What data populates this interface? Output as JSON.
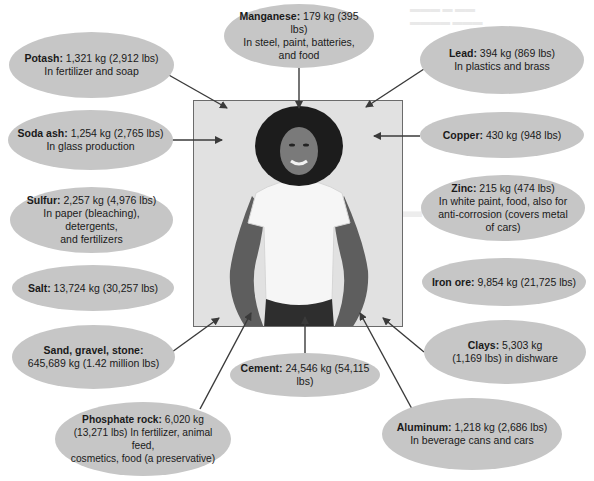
{
  "colors": {
    "bubble_fill": "#c6c6c6",
    "photo_bg": "#e1e1e1",
    "frame_stroke": "#6b6b6b",
    "arrow": "#3a3a3a",
    "text": "#1a1a1a"
  },
  "center": {
    "image_description": "photo of a smiling woman with curly hair in a white t-shirt"
  },
  "minerals": [
    {
      "id": "potash",
      "name": "Potash:",
      "amount": "1,321 kg (2,912 lbs)",
      "lines": [
        "In fertilizer and soap"
      ]
    },
    {
      "id": "manganese",
      "name": "Manganese:",
      "amount": "179 kg (395 lbs)",
      "lines": [
        "In steel, paint, batteries,",
        "and food"
      ]
    },
    {
      "id": "lead",
      "name": "Lead:",
      "amount": "394 kg (869 lbs)",
      "lines": [
        "In plastics and brass"
      ]
    },
    {
      "id": "soda-ash",
      "name": "Soda ash:",
      "amount": "1,254 kg (2,765 lbs)",
      "lines": [
        "In glass production"
      ]
    },
    {
      "id": "copper",
      "name": "Copper:",
      "amount": "430 kg (948 lbs)",
      "lines": []
    },
    {
      "id": "sulfur",
      "name": "Sulfur:",
      "amount": "2,257 kg (4,976 lbs)",
      "lines": [
        "In paper (bleaching), detergents,",
        "and fertilizers"
      ]
    },
    {
      "id": "zinc",
      "name": "Zinc:",
      "amount": "215 kg (474 lbs)",
      "lines": [
        "In white paint, food, also for",
        "anti-corrosion (covers metal",
        "of cars)"
      ]
    },
    {
      "id": "salt",
      "name": "Salt:",
      "amount": "13,724 kg (30,257 lbs)",
      "lines": []
    },
    {
      "id": "iron-ore",
      "name": "Iron ore:",
      "amount": "9,854 kg (21,725 lbs)",
      "lines": []
    },
    {
      "id": "sand-gravel-stone",
      "name": "Sand, gravel, stone:",
      "amount": "",
      "lines": [
        "645,689 kg (1.42 million lbs)"
      ]
    },
    {
      "id": "clays",
      "name": "Clays:",
      "amount": "5,303 kg",
      "lines": [
        "(1,169 lbs) in dishware"
      ]
    },
    {
      "id": "cement",
      "name": "Cement:",
      "amount": "24,546 kg (54,115 lbs)",
      "lines": []
    },
    {
      "id": "phosphate-rock",
      "name": "Phosphate rock:",
      "amount": "6,020 kg",
      "lines": [
        "(13,271 lbs) In fertilizer, animal feed,",
        "cosmetics, food (a preservative)"
      ]
    },
    {
      "id": "aluminum",
      "name": "Aluminum:",
      "amount": "1,218 kg (2,686 lbs)",
      "lines": [
        "In beverage cans and cars"
      ]
    }
  ]
}
